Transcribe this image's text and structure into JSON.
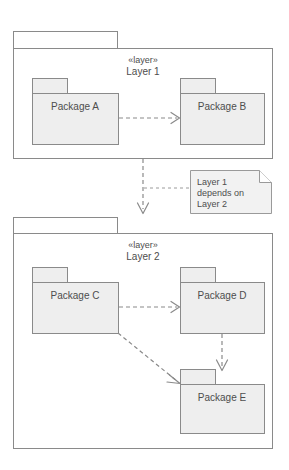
{
  "diagram": {
    "colors": {
      "package_fill": "#eeeeee",
      "package_stroke": "#8a8a8a",
      "layer_fill": "#ffffff",
      "layer_stroke": "#8a8a8a",
      "note_fill": "#f2f2f2",
      "note_stroke": "#9a9a9a",
      "text": "#4d4d4d",
      "background": "#ffffff"
    },
    "layers": [
      {
        "id": "layer-1",
        "stereotype": "«layer»",
        "name": "Layer 1",
        "packages": [
          {
            "id": "package-a",
            "label": "Package A"
          },
          {
            "id": "package-b",
            "label": "Package B"
          }
        ]
      },
      {
        "id": "layer-2",
        "stereotype": "«layer»",
        "name": "Layer 2",
        "packages": [
          {
            "id": "package-c",
            "label": "Package C"
          },
          {
            "id": "package-d",
            "label": "Package D"
          },
          {
            "id": "package-e",
            "label": "Package E"
          }
        ]
      }
    ],
    "note": {
      "id": "dependency-note",
      "lines": [
        "Layer 1",
        "depends on",
        "Layer 2"
      ]
    },
    "dependencies": [
      {
        "id": "dep-a-b",
        "from": "Package A",
        "to": "Package B",
        "style": "dashed"
      },
      {
        "id": "dep-layer1-layer2",
        "from": "Layer 1",
        "to": "Layer 2",
        "style": "dashed"
      },
      {
        "id": "dep-c-d",
        "from": "Package C",
        "to": "Package D",
        "style": "dashed"
      },
      {
        "id": "dep-c-e",
        "from": "Package C",
        "to": "Package E",
        "style": "dashed"
      },
      {
        "id": "dep-d-e",
        "from": "Package D",
        "to": "Package E",
        "style": "dashed"
      }
    ]
  }
}
